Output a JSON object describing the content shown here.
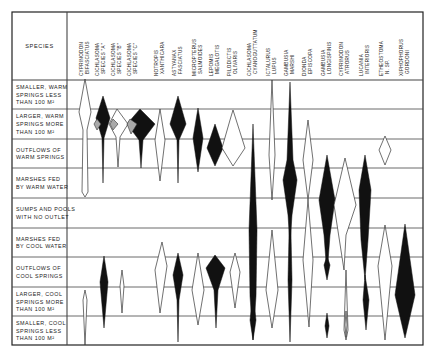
{
  "header": {
    "species_label": "SPECIES"
  },
  "species": [
    {
      "line1": "CYPRINODON",
      "line2": "BIFASCIATUS",
      "x": 85
    },
    {
      "line1": "CICHLASOMA",
      "line2": "SPECIES \"A\"",
      "x": 101
    },
    {
      "line1": "CICHLASOMA",
      "line2": "SPECIES \"B\"",
      "x": 117
    },
    {
      "line1": "CICHLASOMA",
      "line2": "SPECIES \"C\"",
      "x": 133
    },
    {
      "line1": "NOTROPIS",
      "line2": "XANTHICARA",
      "x": 160
    },
    {
      "line1": "ASTYANAX",
      "line2": "FASCIATUS",
      "x": 178
    },
    {
      "line1": "MICROPTERUS",
      "line2": "SALMOIDES",
      "x": 198
    },
    {
      "line1": "LEPOMIS",
      "line2": "MEGALOTIS",
      "x": 215
    },
    {
      "line1": "PILODICTIS",
      "line2": "OLIVARIS",
      "x": 233
    },
    {
      "line1": "CICHLASOMA",
      "line2": "CYANOGUTTATUM",
      "x": 253
    },
    {
      "line1": "ICTALURUS",
      "line2": "LUPUS",
      "x": 272
    },
    {
      "line1": "GAMBUSIA",
      "line2": "MARSHI",
      "x": 290
    },
    {
      "line1": "DIONDA",
      "line2": "EPISCOPA",
      "x": 308
    },
    {
      "line1": "GAMBUSIA",
      "line2": "LONGISPINIS",
      "x": 327
    },
    {
      "line1": "CYPRINODON",
      "line2": "ATRORUS",
      "x": 345
    },
    {
      "line1": "LUCANIA",
      "line2": "INTERIORIS",
      "x": 365
    },
    {
      "line1": "ETHEOSTOMA",
      "line2": "N. SP.",
      "x": 385
    },
    {
      "line1": "XIPHOPHORUS",
      "line2": "GORDONI",
      "x": 405
    }
  ],
  "habitats": [
    {
      "lines": [
        "SMALLER, WARM",
        "SPRINGS LESS",
        "THAN 100 M²"
      ],
      "y0": 80,
      "y1": 109
    },
    {
      "lines": [
        "LARGER, WARM",
        "SPRINGS MORE",
        "THAN 100 M²"
      ],
      "y0": 109,
      "y1": 139
    },
    {
      "lines": [
        "OUTFLOWS OF",
        "WARM SPRINGS"
      ],
      "y0": 139,
      "y1": 168
    },
    {
      "lines": [
        "MARSHES FED",
        "BY WARM WATER"
      ],
      "y0": 168,
      "y1": 198
    },
    {
      "lines": [
        "SUMPS AND POOLS",
        "WITH NO OUTLET"
      ],
      "y0": 198,
      "y1": 228
    },
    {
      "lines": [
        "MARSHES FED",
        "BY COOL WATER"
      ],
      "y0": 228,
      "y1": 257
    },
    {
      "lines": [
        "OUTFLOWS OF",
        "COOL SPRINGS"
      ],
      "y0": 257,
      "y1": 287
    },
    {
      "lines": [
        "LARGER, COOL",
        "SPRINGS MORE",
        "THAN 100 M²"
      ],
      "y0": 287,
      "y1": 316
    },
    {
      "lines": [
        "SMALLER, COOL",
        "SPRINGS LESS",
        "THAN 100 M²"
      ],
      "y0": 316,
      "y1": 345
    }
  ],
  "distributions": [
    {
      "species": 0,
      "style": "open",
      "points": [
        [
          85,
          79
        ],
        [
          91,
          112
        ],
        [
          87,
          130
        ],
        [
          88,
          192
        ],
        [
          85,
          197
        ],
        [
          82,
          192
        ],
        [
          83,
          130
        ],
        [
          79,
          112
        ]
      ]
    },
    {
      "species": 1,
      "style": "filled",
      "points": [
        [
          103,
          96
        ],
        [
          110,
          118
        ],
        [
          104,
          138
        ],
        [
          103,
          183
        ],
        [
          102,
          138
        ],
        [
          96,
          118
        ]
      ]
    },
    {
      "species": 2,
      "style": "open",
      "points": [
        [
          117,
          109
        ],
        [
          128,
          124
        ],
        [
          120,
          137
        ],
        [
          118,
          167
        ],
        [
          116,
          137
        ],
        [
          109,
          124
        ]
      ]
    },
    {
      "species": 3,
      "style": "filled",
      "points": [
        [
          140,
          109
        ],
        [
          155,
          124
        ],
        [
          143,
          140
        ],
        [
          141,
          168
        ],
        [
          139,
          140
        ],
        [
          127,
          124
        ]
      ]
    },
    {
      "species": 4,
      "style": "open",
      "points": [
        [
          160,
          109
        ],
        [
          165,
          140
        ],
        [
          160,
          181
        ],
        [
          155,
          140
        ]
      ]
    },
    {
      "species": 5,
      "style": "filled",
      "points": [
        [
          178,
          96
        ],
        [
          186,
          124
        ],
        [
          179,
          140
        ],
        [
          178,
          183
        ],
        [
          177,
          140
        ],
        [
          170,
          124
        ]
      ]
    },
    {
      "species": 6,
      "style": "filled",
      "points": [
        [
          198,
          108
        ],
        [
          203,
          138
        ],
        [
          198,
          172
        ],
        [
          193,
          138
        ]
      ]
    },
    {
      "species": 7,
      "style": "filled",
      "points": [
        [
          215,
          124
        ],
        [
          223,
          148
        ],
        [
          215,
          166
        ],
        [
          207,
          148
        ]
      ]
    },
    {
      "species": 8,
      "style": "open",
      "points": [
        [
          233,
          110
        ],
        [
          245,
          148
        ],
        [
          233,
          166
        ],
        [
          222,
          148
        ],
        [
          230,
          120
        ]
      ]
    },
    {
      "species": 9,
      "style": "filled",
      "points": [
        [
          253,
          124
        ],
        [
          257,
          230
        ],
        [
          256,
          296
        ],
        [
          253,
          340
        ],
        [
          250,
          296
        ],
        [
          249,
          230
        ]
      ]
    },
    {
      "species": 10,
      "style": "open",
      "points": [
        [
          272,
          80
        ],
        [
          275,
          155
        ],
        [
          272,
          200
        ],
        [
          269,
          155
        ]
      ]
    },
    {
      "species": 11,
      "style": "filled",
      "points": [
        [
          290,
          82
        ],
        [
          293,
          160
        ],
        [
          297,
          180
        ],
        [
          292,
          215
        ],
        [
          290,
          245
        ],
        [
          288,
          215
        ],
        [
          283,
          180
        ],
        [
          287,
          160
        ]
      ]
    },
    {
      "species": 12,
      "style": "open",
      "points": [
        [
          308,
          120
        ],
        [
          313,
          160
        ],
        [
          308,
          200
        ],
        [
          303,
          160
        ]
      ]
    },
    {
      "species": 13,
      "style": "filled",
      "points": [
        [
          327,
          155
        ],
        [
          335,
          200
        ],
        [
          330,
          235
        ],
        [
          327,
          275
        ],
        [
          324,
          235
        ],
        [
          319,
          200
        ]
      ]
    },
    {
      "species": 14,
      "style": "open",
      "points": [
        [
          345,
          158
        ],
        [
          356,
          205
        ],
        [
          346,
          235
        ],
        [
          344,
          270
        ],
        [
          334,
          205
        ]
      ]
    },
    {
      "species": 15,
      "style": "filled",
      "points": [
        [
          365,
          155
        ],
        [
          371,
          190
        ],
        [
          368,
          240
        ],
        [
          365,
          280
        ],
        [
          361,
          240
        ],
        [
          359,
          190
        ]
      ]
    },
    {
      "species": 16,
      "style": "open",
      "points": [
        [
          385,
          136
        ],
        [
          391,
          150
        ],
        [
          385,
          165
        ],
        [
          379,
          150
        ]
      ]
    },
    {
      "species": 0,
      "style": "open",
      "points": [
        [
          85,
          290
        ],
        [
          87,
          300
        ],
        [
          85,
          345
        ],
        [
          83,
          300
        ]
      ]
    },
    {
      "species": 1,
      "style": "filled",
      "points": [
        [
          104,
          256
        ],
        [
          108,
          282
        ],
        [
          104,
          328
        ],
        [
          100,
          282
        ]
      ]
    },
    {
      "species": 2,
      "style": "open",
      "points": [
        [
          122,
          270
        ],
        [
          124,
          286
        ],
        [
          122,
          313
        ],
        [
          120,
          286
        ]
      ]
    },
    {
      "species": 4,
      "style": "open",
      "points": [
        [
          162,
          242
        ],
        [
          167,
          266
        ],
        [
          160,
          313
        ],
        [
          155,
          270
        ]
      ]
    },
    {
      "species": 5,
      "style": "filled",
      "points": [
        [
          178,
          253
        ],
        [
          183,
          275
        ],
        [
          179,
          300
        ],
        [
          178,
          342
        ],
        [
          177,
          300
        ],
        [
          173,
          275
        ]
      ]
    },
    {
      "species": 6,
      "style": "open",
      "points": [
        [
          198,
          253
        ],
        [
          204,
          290
        ],
        [
          198,
          325
        ],
        [
          192,
          290
        ]
      ]
    },
    {
      "species": 7,
      "style": "filled",
      "points": [
        [
          215,
          255
        ],
        [
          225,
          268
        ],
        [
          218,
          290
        ],
        [
          216,
          328
        ],
        [
          214,
          290
        ],
        [
          206,
          268
        ]
      ]
    },
    {
      "species": 8,
      "style": "open",
      "points": [
        [
          235,
          253
        ],
        [
          240,
          272
        ],
        [
          235,
          308
        ],
        [
          230,
          272
        ]
      ]
    },
    {
      "species": 9,
      "style": "filled",
      "points": [
        [
          253,
          294
        ],
        [
          256,
          320
        ],
        [
          253,
          340
        ],
        [
          250,
          320
        ]
      ]
    },
    {
      "species": 10,
      "style": "open",
      "points": [
        [
          272,
          230
        ],
        [
          278,
          290
        ],
        [
          272,
          328
        ],
        [
          266,
          290
        ]
      ]
    },
    {
      "species": 11,
      "style": "filled",
      "points": [
        [
          290,
          190
        ],
        [
          292,
          280
        ],
        [
          290,
          342
        ],
        [
          288,
          280
        ]
      ]
    },
    {
      "species": 12,
      "style": "open",
      "points": [
        [
          308,
          200
        ],
        [
          313,
          260
        ],
        [
          309,
          327
        ],
        [
          303,
          260
        ]
      ]
    },
    {
      "species": 13,
      "style": "filled",
      "points": [
        [
          327,
          256
        ],
        [
          330,
          265
        ],
        [
          327,
          280
        ],
        [
          324,
          265
        ]
      ]
    },
    {
      "species": 14,
      "style": "open",
      "points": [
        [
          346,
          270
        ],
        [
          348,
          330
        ],
        [
          346,
          340
        ],
        [
          344,
          330
        ]
      ]
    },
    {
      "species": 15,
      "style": "filled",
      "points": [
        [
          365,
          275
        ],
        [
          369,
          300
        ],
        [
          366,
          330
        ],
        [
          363,
          300
        ]
      ]
    },
    {
      "species": 16,
      "style": "open",
      "points": [
        [
          385,
          225
        ],
        [
          392,
          266
        ],
        [
          385,
          340
        ],
        [
          378,
          266
        ]
      ]
    },
    {
      "species": 17,
      "style": "filled",
      "points": [
        [
          405,
          224
        ],
        [
          415,
          295
        ],
        [
          405,
          338
        ],
        [
          395,
          295
        ]
      ]
    },
    {
      "species": 13,
      "style": "filled",
      "points": [
        [
          327,
          313
        ],
        [
          329,
          326
        ],
        [
          327,
          338
        ],
        [
          325,
          326
        ]
      ]
    },
    {
      "species": 15,
      "style": "open",
      "points": [
        [
          346,
          311
        ],
        [
          347,
          325
        ],
        [
          346,
          337
        ],
        [
          345,
          325
        ]
      ]
    }
  ],
  "overlaps": [
    {
      "points": [
        [
          97,
          119
        ],
        [
          101,
          124
        ],
        [
          97,
          130
        ],
        [
          94,
          124
        ]
      ]
    },
    {
      "points": [
        [
          113,
          119
        ],
        [
          118,
          124
        ],
        [
          113,
          130
        ],
        [
          110,
          124
        ]
      ]
    },
    {
      "points": [
        [
          130,
          119
        ],
        [
          137,
          124
        ],
        [
          131,
          134
        ],
        [
          127,
          124
        ]
      ]
    }
  ]
}
